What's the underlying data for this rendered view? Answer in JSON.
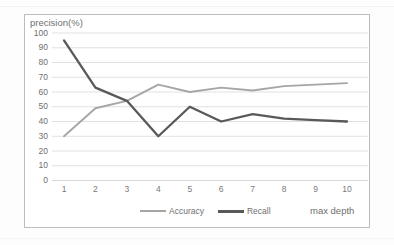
{
  "chart_data": {
    "type": "line",
    "title": "",
    "ylabel": "precision(%)",
    "xlabel": "max depth",
    "categories": [
      "1",
      "2",
      "3",
      "4",
      "5",
      "6",
      "7",
      "8",
      "9",
      "10"
    ],
    "x": [
      1,
      2,
      3,
      4,
      5,
      6,
      7,
      8,
      9,
      10
    ],
    "series": [
      {
        "name": "Accuracy",
        "color": "#a6a6a6",
        "values": [
          30,
          49,
          54,
          65,
          60,
          63,
          61,
          64,
          65,
          66
        ]
      },
      {
        "name": "Recall",
        "color": "#595959",
        "values": [
          95,
          63,
          54,
          30,
          50,
          40,
          45,
          42,
          41,
          40
        ]
      }
    ],
    "ylim": [
      0,
      100
    ],
    "ytick_labels": [
      "100",
      "90",
      "80",
      "70",
      "60",
      "50",
      "40",
      "30",
      "20",
      "10",
      "0"
    ],
    "ytick_values": [
      100,
      90,
      80,
      70,
      60,
      50,
      40,
      30,
      20,
      10,
      0
    ],
    "xlim": [
      1,
      10
    ],
    "grid": "horizontal",
    "grid_color": "#d9d9d9",
    "legend_position": "bottom-center",
    "legend_entries": [
      "Accuracy",
      "Recall"
    ],
    "plot_border_color": "#bdbdbd",
    "background": "#ffffff"
  },
  "axes": {
    "y_axis_title": "precision(%)",
    "x_axis_title": "max depth"
  },
  "legend": {
    "items": [
      {
        "label": "Accuracy"
      },
      {
        "label": "Recall"
      }
    ]
  }
}
